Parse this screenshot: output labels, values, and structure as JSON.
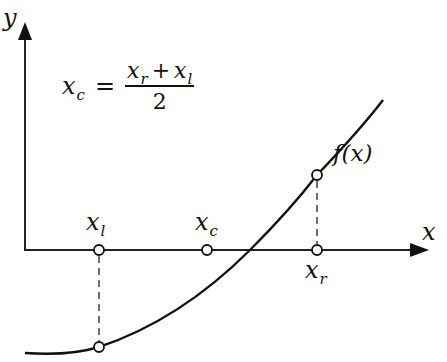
{
  "diagram": {
    "formula": {
      "lhs": "x",
      "lhs_sub": "c",
      "equals": "=",
      "numerator_a": "x",
      "numerator_a_sub": "r",
      "plus": "+",
      "numerator_b": "x",
      "numerator_b_sub": "l",
      "denominator": "2"
    },
    "axes": {
      "x_label": "x",
      "y_label": "y"
    },
    "curve": {
      "label": "f(x)"
    },
    "points": [
      {
        "id": "xl",
        "label": "x",
        "sub": "l",
        "axis_x": 99,
        "curve_y": 347
      },
      {
        "id": "xc",
        "label": "x",
        "sub": "c",
        "axis_x": 207
      },
      {
        "id": "xr",
        "label": "x",
        "sub": "r",
        "axis_x": 317,
        "curve_y": 175
      }
    ],
    "colors": {
      "ink": "#111111",
      "background": "#ffffff"
    }
  }
}
